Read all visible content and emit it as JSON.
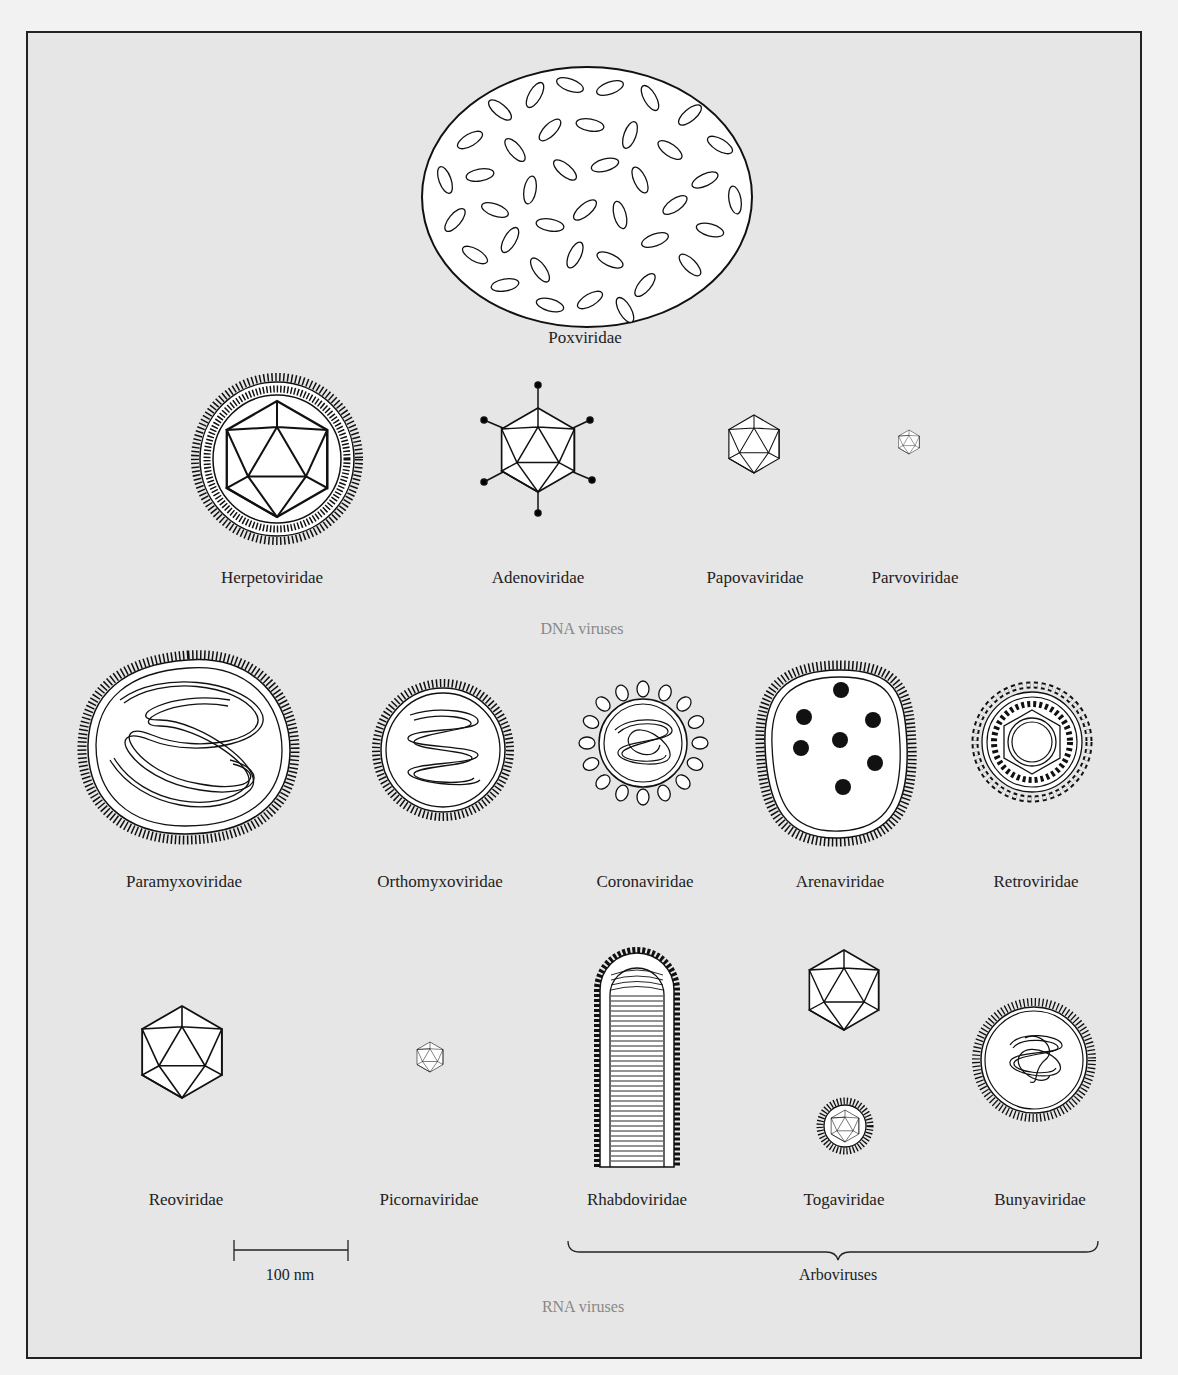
{
  "figure": {
    "dna_group_label": "DNA viruses",
    "rna_group_label": "RNA viruses",
    "arbovirus_label": "Arboviruses",
    "scale_bar_label": "100 nm"
  },
  "dna_viruses": [
    {
      "name": "Poxviridae",
      "x": 585,
      "y": 338
    },
    {
      "name": "Herpetoviridae",
      "x": 272,
      "y": 578
    },
    {
      "name": "Adenoviridae",
      "x": 538,
      "y": 578
    },
    {
      "name": "Papovaviridae",
      "x": 755,
      "y": 578
    },
    {
      "name": "Parvoviridae",
      "x": 915,
      "y": 578
    }
  ],
  "rna_viruses_row1": [
    {
      "name": "Paramyxoviridae",
      "x": 184,
      "y": 882
    },
    {
      "name": "Orthomyxoviridae",
      "x": 440,
      "y": 882
    },
    {
      "name": "Coronaviridae",
      "x": 645,
      "y": 882
    },
    {
      "name": "Arenaviridae",
      "x": 840,
      "y": 882
    },
    {
      "name": "Retroviridae",
      "x": 1036,
      "y": 882
    }
  ],
  "rna_viruses_row2": [
    {
      "name": "Reoviridae",
      "x": 186,
      "y": 1200
    },
    {
      "name": "Picornaviridae",
      "x": 429,
      "y": 1200
    },
    {
      "name": "Rhabdoviridae",
      "x": 637,
      "y": 1200
    },
    {
      "name": "Togaviridae",
      "x": 844,
      "y": 1200
    },
    {
      "name": "Bunyaviridae",
      "x": 1040,
      "y": 1200
    }
  ],
  "colors": {
    "background": "#e6e6e6",
    "line": "#111111",
    "fill": "#ffffff",
    "group_label": "#888888"
  }
}
